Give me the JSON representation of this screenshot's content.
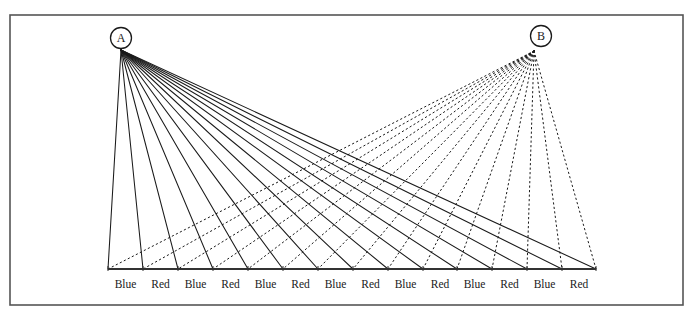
{
  "figure": {
    "name": "two-source-ray-fan-diagram",
    "background_color": "#ffffff",
    "frame": {
      "stroke_color": "#555555",
      "x": 10,
      "y": 15,
      "width": 673,
      "height": 290
    },
    "baseline": {
      "name": "baseline-axis",
      "stroke_color": "#333333",
      "x_start": 108,
      "x_end": 596,
      "y": 269
    },
    "nodes": [
      {
        "id": "A",
        "label": "A",
        "name": "node-a",
        "ray_style": "solid",
        "circle_cx": 121,
        "circle_cy": 38,
        "circle_r": 10.5,
        "apex_x": 121,
        "apex_y": 50,
        "stroke_color": "#1a1a1a"
      },
      {
        "id": "B",
        "label": "B",
        "name": "node-b",
        "ray_style": "dotted",
        "circle_cx": 541,
        "circle_cy": 36,
        "circle_r": 10.5,
        "apex_x": 534,
        "apex_y": 51,
        "stroke_color": "#1a1a1a"
      }
    ],
    "axis_labels": [
      "Blue",
      "Red",
      "Blue",
      "Red",
      "Blue",
      "Red",
      "Blue",
      "Red",
      "Blue",
      "Red",
      "Blue",
      "Red",
      "Blue",
      "Red"
    ],
    "axis_label_y": 288,
    "ray_count_a": 15,
    "ray_count_b": 15,
    "caption": ""
  },
  "chart_data": {
    "type": "line",
    "title": "",
    "xlabel": "",
    "ylabel": "",
    "grid": false,
    "legend": "none",
    "categories": [
      "Blue",
      "Red",
      "Blue",
      "Red",
      "Blue",
      "Red",
      "Blue",
      "Red",
      "Blue",
      "Red",
      "Blue",
      "Red",
      "Blue",
      "Red"
    ],
    "series": [
      {
        "name": "Rays from A (solid)",
        "apex": [
          121,
          50
        ],
        "style": "solid",
        "terminal_x": [
          108,
          143,
          178,
          213,
          248,
          283,
          318,
          353,
          388,
          423,
          457,
          492,
          527,
          562,
          596
        ],
        "terminal_y": 269
      },
      {
        "name": "Rays from B (dotted)",
        "apex": [
          534,
          51
        ],
        "style": "dotted",
        "terminal_x": [
          108,
          143,
          178,
          213,
          248,
          283,
          318,
          353,
          388,
          423,
          457,
          492,
          527,
          562,
          596
        ],
        "terminal_y": 269
      }
    ],
    "xlim": [
      108,
      596
    ],
    "ylim": [
      50,
      269
    ]
  }
}
